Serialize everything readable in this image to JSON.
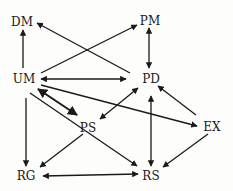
{
  "diagram": {
    "type": "directed-graph",
    "nodes": [
      {
        "id": "DM",
        "label": "DM",
        "x": 22,
        "y": 22
      },
      {
        "id": "PM",
        "label": "PM",
        "x": 150,
        "y": 21
      },
      {
        "id": "UM",
        "label": "UM",
        "x": 24,
        "y": 79
      },
      {
        "id": "PD",
        "label": "PD",
        "x": 151,
        "y": 79
      },
      {
        "id": "PS",
        "label": "PS",
        "x": 88,
        "y": 127
      },
      {
        "id": "EX",
        "label": "EX",
        "x": 212,
        "y": 127
      },
      {
        "id": "RG",
        "label": "RG",
        "x": 26,
        "y": 175
      },
      {
        "id": "RS",
        "label": "RS",
        "x": 151,
        "y": 175
      }
    ],
    "edges": [
      {
        "from": "UM",
        "to": "DM",
        "bidirectional": false
      },
      {
        "from": "PD",
        "to": "DM",
        "bidirectional": false
      },
      {
        "from": "UM",
        "to": "PM",
        "bidirectional": false
      },
      {
        "from": "PM",
        "to": "PD",
        "bidirectional": true
      },
      {
        "from": "UM",
        "to": "PD",
        "bidirectional": true
      },
      {
        "from": "UM",
        "to": "PS",
        "bidirectional": true
      },
      {
        "from": "UM",
        "to": "EX",
        "bidirectional": false
      },
      {
        "from": "PS",
        "to": "PD",
        "bidirectional": true
      },
      {
        "from": "EX",
        "to": "PD",
        "bidirectional": false
      },
      {
        "from": "RS",
        "to": "PD",
        "bidirectional": true
      },
      {
        "from": "UM",
        "to": "RG",
        "bidirectional": false
      },
      {
        "from": "UM",
        "to": "RS",
        "bidirectional": false
      },
      {
        "from": "PS",
        "to": "RG",
        "bidirectional": false
      },
      {
        "from": "EX",
        "to": "RS",
        "bidirectional": false
      },
      {
        "from": "RG",
        "to": "RS",
        "bidirectional": true
      }
    ],
    "colors": {
      "ink": "#1a1a1a",
      "background": "#fdfdfb"
    }
  }
}
